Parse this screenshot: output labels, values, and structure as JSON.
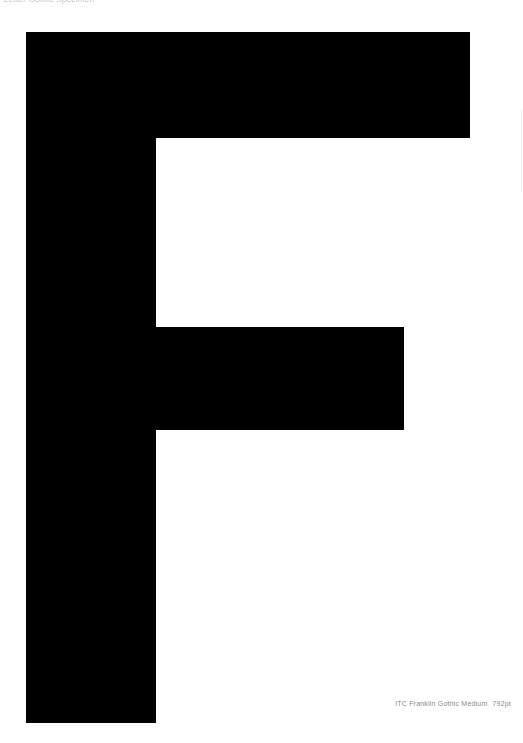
{
  "header": {
    "text": "Letter Gothic Specimen"
  },
  "specimen": {
    "letter": "F",
    "color": "#000000",
    "background": "#ffffff"
  },
  "caption": {
    "font_name": "ITC Franklin Gothic Medium",
    "size": "792pt"
  }
}
